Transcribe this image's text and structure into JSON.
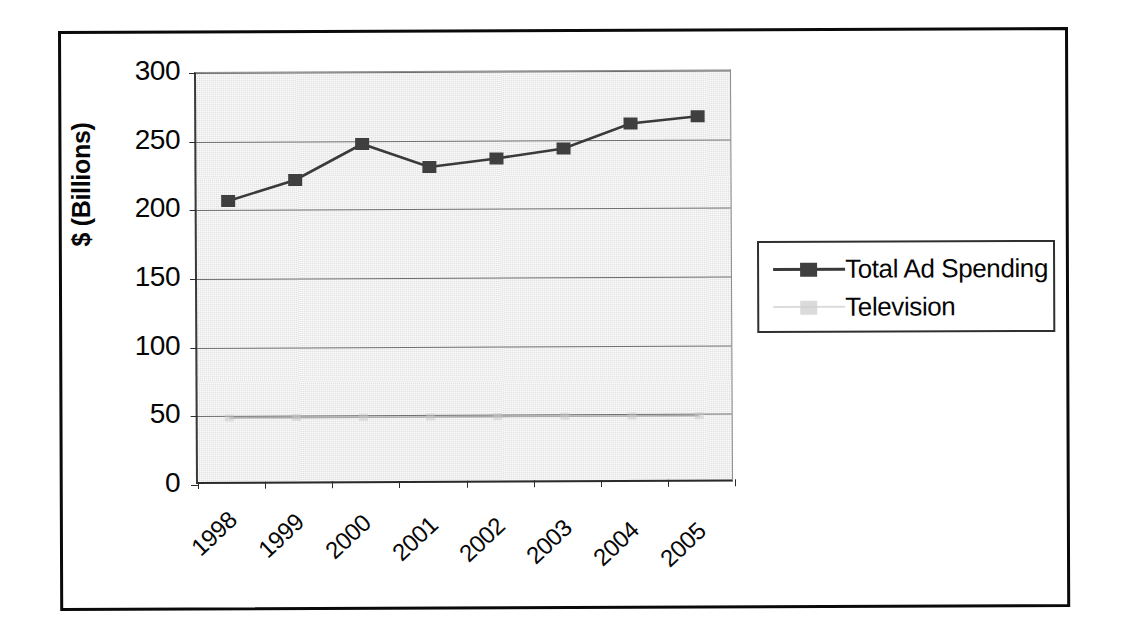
{
  "chart_data": {
    "type": "line",
    "title": "",
    "subtitle": "",
    "xlabel": "",
    "ylabel": "$ (Billions)",
    "categories": [
      "1998",
      "1999",
      "2000",
      "2001",
      "2002",
      "2003",
      "2004",
      "2005"
    ],
    "series": [
      {
        "name": "Total Ad Spending",
        "values": [
          206,
          221,
          247,
          230,
          236,
          243,
          261,
          266
        ],
        "marker": "square",
        "color": "#3a3a3a",
        "visible": true
      },
      {
        "name": "Television",
        "values": [
          48,
          48,
          48,
          48,
          48,
          48,
          48,
          48
        ],
        "marker": "square",
        "color": "#9a9a9a",
        "visible": true
      }
    ],
    "ylim": [
      0,
      300
    ],
    "yticks": [
      0,
      50,
      100,
      150,
      200,
      250,
      300
    ],
    "ytick_labels": [
      "0",
      "50",
      "100",
      "150",
      "200",
      "250",
      "300"
    ],
    "grid": "horizontal",
    "legend_position": "right",
    "plot_background": "#e3e3e3"
  },
  "axes": {
    "y_title": "$ (Billions)",
    "y_tick_labels": [
      "300",
      "250",
      "200",
      "150",
      "100",
      "50",
      "0"
    ],
    "x_tick_labels": [
      "1998",
      "1999",
      "2000",
      "2001",
      "2002",
      "2003",
      "2004",
      "2005"
    ]
  },
  "legend": {
    "items": [
      {
        "label": "Total Ad Spending",
        "color": "#3a3a3a",
        "marker": "square-marker"
      },
      {
        "label": "Television",
        "color": "#b9b9b9",
        "marker": "square-marker"
      }
    ]
  }
}
